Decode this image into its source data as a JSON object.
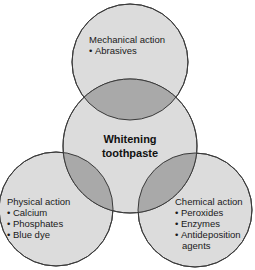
{
  "diagram": {
    "type": "venn",
    "center": {
      "title_line1": "Whitening",
      "title_line2": "toothpaste"
    },
    "circles": [
      {
        "title": "Mechanical action",
        "items": [
          "Abrasives"
        ]
      },
      {
        "title": "Physical action",
        "items": [
          "Calcium",
          "Phosphates",
          "Blue dye"
        ]
      },
      {
        "title": "Chemical action",
        "items": [
          "Peroxides",
          "Enzymes",
          "Antideposition"
        ],
        "item_continuation": "agents"
      }
    ],
    "colors": {
      "fill": "#dcdcdc",
      "overlap": "#a9a9a9",
      "stroke": "#3a3a3a",
      "background": "#ffffff"
    }
  }
}
